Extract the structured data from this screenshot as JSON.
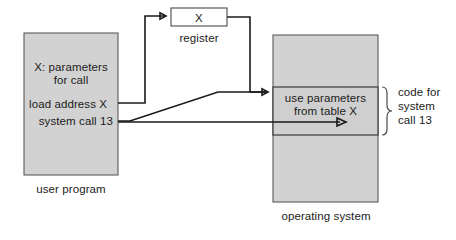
{
  "diagram": {
    "colors": {
      "box_fill": "#d2d2d2",
      "band_fill": "#cfcfcf",
      "register_fill": "#ffffff",
      "stroke": "#1a1a1a",
      "text": "#1b1b1b",
      "background": "#ffffff"
    },
    "user_program": {
      "caption": "user program",
      "line_1": "X: parameters",
      "line_2": "for call",
      "line_3": "load address X",
      "line_4": "system call 13"
    },
    "register": {
      "value": "X",
      "caption": "register"
    },
    "operating_system": {
      "caption": "operating system",
      "band_line_1": "use parameters",
      "band_line_2": "from table X"
    },
    "annotation": {
      "line_1": "code for",
      "line_2": "system",
      "line_3": "call 13"
    },
    "connectors": [
      {
        "name": "load-address-to-register",
        "from": "load address X",
        "to": "register"
      },
      {
        "name": "register-to-os-band",
        "from": "register",
        "to": "use parameters from table X"
      },
      {
        "name": "system-call-to-os-band",
        "from": "system call 13",
        "to": "use parameters from table X"
      },
      {
        "name": "os-band-execution",
        "from": "system call 13",
        "to": "from table X"
      }
    ]
  }
}
